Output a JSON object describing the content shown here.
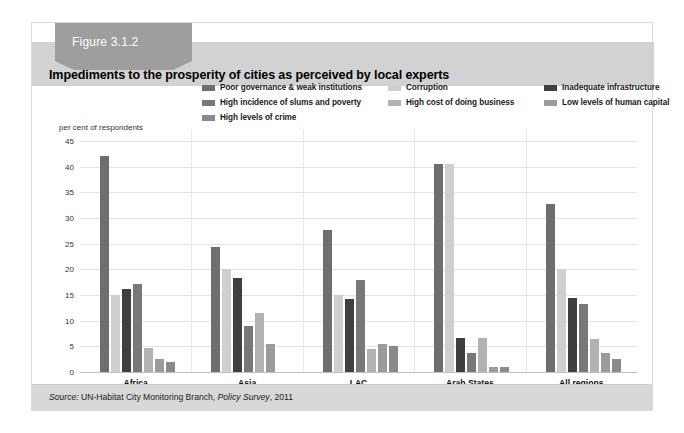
{
  "figure": {
    "tab_label": "Figure 3.1.2",
    "title": "Impediments to the prosperity of cities as perceived by local experts",
    "source_prefix": "Source:",
    "source_body": " UN-Habitat City Monitoring Branch, ",
    "source_italic": "Policy Survey",
    "source_suffix": ", 2011"
  },
  "chart_data": {
    "type": "bar",
    "title": "Impediments to the prosperity of cities as perceived by local experts",
    "xlabel": "",
    "ylabel": "per cent of respondents",
    "ylim": [
      0,
      45
    ],
    "yticks": [
      0,
      5,
      10,
      15,
      20,
      25,
      30,
      35,
      40,
      45
    ],
    "grid": true,
    "legend_position": "top",
    "categories": [
      "Africa",
      "Asia",
      "LAC",
      "Arab States",
      "All regions"
    ],
    "series": [
      {
        "name": "Poor governance & weak institutions",
        "color": "#6e6e6e",
        "values": [
          42.0,
          24.3,
          27.6,
          40.5,
          32.8
        ]
      },
      {
        "name": "Corruption",
        "color": "#cfcfcf",
        "values": [
          15.0,
          20.0,
          15.0,
          40.5,
          20.0
        ]
      },
      {
        "name": "Inadequate infrastructure",
        "color": "#3f3f3f",
        "values": [
          16.1,
          18.3,
          14.2,
          6.6,
          14.4
        ]
      },
      {
        "name": "High incidence of slums and poverty",
        "color": "#787878",
        "values": [
          17.1,
          9.0,
          18.0,
          3.7,
          13.3
        ]
      },
      {
        "name": "High cost of doing business",
        "color": "#b2b2b2",
        "values": [
          4.6,
          11.5,
          4.5,
          6.7,
          6.5
        ]
      },
      {
        "name": "Low levels of human capital",
        "color": "#9b9b9b",
        "values": [
          2.5,
          5.4,
          5.4,
          1.0,
          3.8
        ]
      },
      {
        "name": "High levels of crime",
        "color": "#8a8a8a",
        "values": [
          2.0,
          0.0,
          5.0,
          0.9,
          2.6
        ]
      }
    ]
  }
}
